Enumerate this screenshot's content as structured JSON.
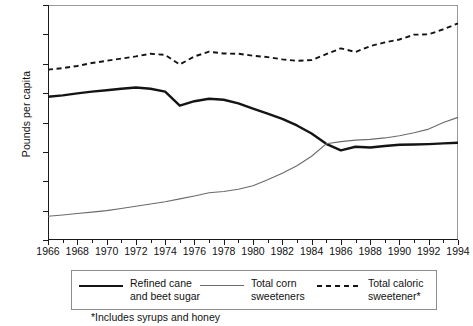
{
  "chart_data": {
    "type": "line",
    "title": "",
    "xlabel": "",
    "ylabel": "Pounds per capita",
    "xlim": [
      1966,
      1994
    ],
    "ylim": [
      0,
      160
    ],
    "ytick_labels": [
      "0",
      "20",
      "40",
      "60",
      "80",
      "100",
      "120",
      "140",
      "160"
    ],
    "ytick_values": [
      0,
      20,
      40,
      60,
      80,
      100,
      120,
      140,
      160
    ],
    "xtick_labels": [
      "1966",
      "1968",
      "1970",
      "1972",
      "1974",
      "1976",
      "1978",
      "1980",
      "1982",
      "1984",
      "1986",
      "1988",
      "1990",
      "1992",
      "1994"
    ],
    "xtick_values": [
      1966,
      1968,
      1970,
      1972,
      1974,
      1976,
      1978,
      1980,
      1982,
      1984,
      1986,
      1988,
      1990,
      1992,
      1994
    ],
    "x": [
      1966,
      1967,
      1968,
      1969,
      1970,
      1971,
      1972,
      1973,
      1974,
      1975,
      1976,
      1977,
      1978,
      1979,
      1980,
      1981,
      1982,
      1983,
      1984,
      1985,
      1986,
      1987,
      1988,
      1989,
      1990,
      1991,
      1992,
      1993,
      1994
    ],
    "grid": false,
    "legend_position": "below",
    "series": [
      {
        "name": "Refined cane and beet sugar",
        "style": "solid-thick",
        "color": "#141414",
        "values": [
          97.5,
          98.5,
          99.8,
          101.0,
          102.0,
          103.0,
          103.8,
          103.0,
          101.0,
          91.5,
          94.5,
          96.2,
          95.5,
          93.0,
          89.5,
          86.0,
          82.5,
          78.0,
          72.5,
          65.5,
          61.0,
          63.5,
          63.0,
          64.0,
          64.8,
          65.0,
          65.3,
          65.8,
          66.2
        ]
      },
      {
        "name": "Total corn sweeteners",
        "style": "solid-thin",
        "color": "#6b6b6b",
        "values": [
          16.2,
          17.0,
          18.0,
          19.0,
          20.0,
          21.5,
          23.0,
          24.5,
          26.0,
          28.0,
          30.0,
          32.2,
          33.0,
          34.5,
          37.0,
          41.0,
          45.5,
          50.5,
          57.0,
          65.5,
          67.0,
          68.0,
          68.5,
          69.5,
          71.0,
          73.0,
          75.5,
          80.0,
          83.5
        ]
      },
      {
        "name": "Total caloric sweetener*",
        "style": "dashed",
        "color": "#141414",
        "values": [
          116.0,
          117.0,
          118.5,
          120.5,
          122.0,
          123.5,
          125.0,
          126.8,
          126.0,
          119.5,
          125.0,
          128.2,
          127.0,
          126.8,
          125.5,
          124.5,
          123.0,
          122.0,
          122.5,
          126.5,
          130.5,
          128.0,
          132.0,
          134.5,
          136.5,
          139.8,
          140.0,
          143.5,
          147.5
        ]
      }
    ],
    "footnote": "*Includes syrups and honey",
    "legend": [
      {
        "label_line1": "Refined cane",
        "label_line2": "and beet sugar",
        "key": "solid-thick"
      },
      {
        "label_line1": "Total corn",
        "label_line2": "sweeteners",
        "key": "solid-thin"
      },
      {
        "label_line1": "Total caloric",
        "label_line2": "sweetener*",
        "key": "dashed"
      }
    ]
  }
}
